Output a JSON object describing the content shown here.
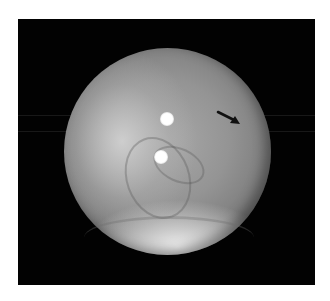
{
  "image": {
    "description": "Grayscale spherical image on black background with two bright circular reflections and a black arrow pointing toward the upper-right region",
    "colors": {
      "page_background": "#ffffff",
      "frame_background": "#020202",
      "sphere_mid": "#949494",
      "highlight": "#ffffff",
      "arrow": "#111111"
    },
    "annotations": [
      {
        "type": "arrow",
        "direction": "down-right",
        "label": ""
      }
    ],
    "reflections": 2
  }
}
